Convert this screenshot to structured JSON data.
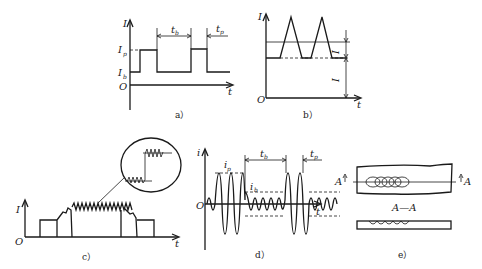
{
  "figure": {
    "panels": [
      {
        "id": "a",
        "caption": "a）",
        "y_axis": "I",
        "x_axis": "t",
        "origin": "O",
        "labels": {
          "peak": "I",
          "peak_sub": "p",
          "base": "I",
          "base_sub": "b",
          "tb": "t",
          "tb_sub": "b",
          "tp": "t",
          "tp_sub": "p"
        },
        "description": "Rectangular pulse current waveform"
      },
      {
        "id": "b",
        "caption": "b）",
        "y_axis": "I",
        "x_axis": "t",
        "origin": "O",
        "labels": {
          "ip": "I",
          "ip_sub": "p",
          "ib": "I",
          "ib_sub": "b"
        },
        "description": "Triangular pulse current waveform"
      },
      {
        "id": "c",
        "caption": "c）",
        "y_axis": "I",
        "x_axis": "t",
        "origin": "O",
        "description": "Stepped current with superimposed pulses and magnified detail"
      },
      {
        "id": "d",
        "caption": "d）",
        "y_axis": "i",
        "x_axis": "t",
        "origin": "O",
        "labels": {
          "ip": "i",
          "ip_sub": "p",
          "ib": "i",
          "ib_sub": "b",
          "tb": "t",
          "tb_sub": "b",
          "tp": "t",
          "tp_sub": "p"
        },
        "description": "AC pulse current waveform"
      },
      {
        "id": "e",
        "caption": "e）",
        "section_marker": "A",
        "section_label": "A—A",
        "description": "Weld bead plan view and A—A cross-section"
      }
    ]
  }
}
